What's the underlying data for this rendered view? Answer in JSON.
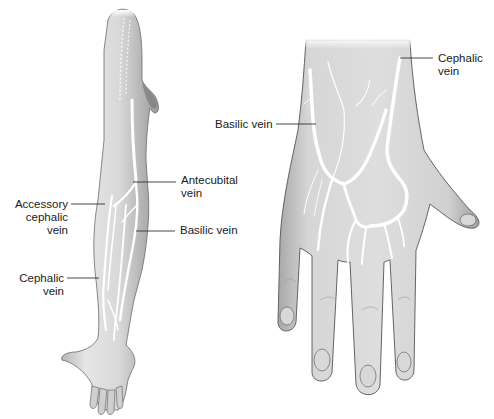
{
  "diagram": {
    "panels": [
      {
        "id": "arm",
        "description": "Anterior view of whole arm with forearm veins",
        "labels": [
          {
            "key": "accessory_cephalic",
            "text": "Accessory\ncephalic\nvein"
          },
          {
            "key": "antecubital",
            "text": "Antecubital\nvein"
          },
          {
            "key": "basilic",
            "text": "Basilic vein"
          },
          {
            "key": "cephalic",
            "text": "Cephalic\nvein"
          }
        ]
      },
      {
        "id": "hand",
        "description": "Dorsal view of hand with dorsal venous network",
        "labels": [
          {
            "key": "cephalic",
            "text": "Cephalic\nvein"
          },
          {
            "key": "basilic",
            "text": "Basilic vein"
          }
        ]
      }
    ],
    "colors": {
      "skin_light": "#ececec",
      "skin_mid": "#c8c8c8",
      "skin_dark": "#8e8e8e",
      "outline": "#555555",
      "vein": "#ffffff",
      "leader_line": "#333333",
      "text": "#1a1a1a"
    }
  }
}
